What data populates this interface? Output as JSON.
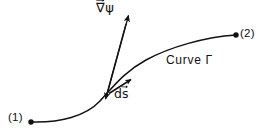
{
  "figure": {
    "kind": "line-integral-diagram",
    "background_color": "#ffffff",
    "ink_color": "#111111",
    "labels": {
      "start_point": "(1)",
      "end_point": "(2)",
      "curve": "Curve Γ",
      "gradient_nabla": "∇",
      "gradient_field": "ψ",
      "differential_d": "d",
      "differential_s": "s"
    },
    "geometry": {
      "curve_start": [
        31,
        122
      ],
      "curve_end": [
        236,
        35
      ],
      "curve_control_1": [
        78,
        124
      ],
      "curve_control_2": [
        96,
        98
      ],
      "curve_mid": [
        110,
        93
      ],
      "curve_control_3": [
        140,
        84
      ],
      "curve_control_4": [
        186,
        38
      ],
      "gradient_tail": [
        106,
        96
      ],
      "gradient_tip": [
        129,
        14
      ],
      "ds_tail": [
        110,
        92
      ],
      "ds_tip": [
        132,
        79
      ],
      "endpoint_dot_radius": 2.6
    }
  }
}
